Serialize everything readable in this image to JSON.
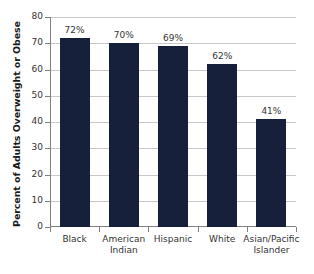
{
  "chart_data": {
    "type": "bar",
    "title": "",
    "subtitle": "",
    "xlabel": "",
    "ylabel": "Percent of Adults Overweight or Obese",
    "ylim": [
      0,
      80
    ],
    "ytick_step": 10,
    "yticks": [
      "80",
      "70",
      "60",
      "50",
      "40",
      "30",
      "20",
      "10",
      "0"
    ],
    "grid": true,
    "legend": false,
    "legend_position": "none",
    "categories": [
      "Black",
      "American Indian",
      "Hispanic",
      "White",
      "Asian/Pacific Islander"
    ],
    "category_lines": [
      [
        "Black"
      ],
      [
        "American",
        "Indian"
      ],
      [
        "Hispanic"
      ],
      [
        "White"
      ],
      [
        "Asian/Pacific",
        "Islander"
      ]
    ],
    "values": [
      72,
      70,
      69,
      62,
      41
    ],
    "data_labels": [
      "72%",
      "70%",
      "69%",
      "62%",
      "41%"
    ],
    "series": [
      {
        "name": "Percent of Adults Overweight or Obese",
        "values": [
          72,
          70,
          69,
          62,
          41
        ]
      }
    ],
    "colors": {
      "bar": "#16203a",
      "gridline": "#c8c8c8",
      "axis": "#808080",
      "text": "#333333",
      "axis_title": "#1a1a1a",
      "background": "#ffffff"
    }
  }
}
